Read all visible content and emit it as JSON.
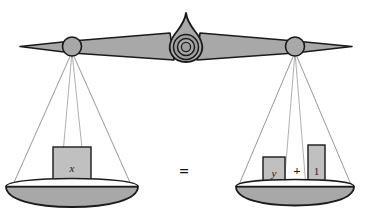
{
  "figure": {
    "equation_statement": "x = y + 1",
    "colors": {
      "fill_gray": "#a8a8a8",
      "block_gray": "#c0c0c0",
      "outline": "#1a1a1a",
      "string_gray": "#8c8c8c",
      "background": "#ffffff"
    }
  },
  "beam": {
    "name": "balance-beam",
    "left_tip_x": 20,
    "right_tip_x": 352,
    "center_x": 186,
    "pivot_y": 46,
    "left_hanger_x": 72,
    "right_hanger_x": 295
  },
  "fulcrum": {
    "name": "fulcrum-pivot",
    "center_x": 186,
    "center_y": 47,
    "outer_radius": 13,
    "mid_radius": 9,
    "inner_radius": 5
  },
  "left_pan": {
    "name": "left-pan",
    "center_x": 72,
    "top_y": 186,
    "half_width": 66,
    "depth": 12,
    "items": [
      {
        "label": "x",
        "style": "italic",
        "width": 38,
        "height": 40
      }
    ]
  },
  "right_pan": {
    "name": "right-pan",
    "center_x": 295,
    "top_y": 186,
    "half_width": 59,
    "depth": 11,
    "items": [
      {
        "label": "y",
        "style": "italic",
        "width": 22,
        "height": 30
      },
      {
        "label": "+",
        "style": "operator"
      },
      {
        "label": "1",
        "style": "upright",
        "width": 17,
        "height": 42
      }
    ]
  },
  "center_operator": {
    "name": "equals-sign",
    "label": "=",
    "x": 184,
    "y": 172
  }
}
